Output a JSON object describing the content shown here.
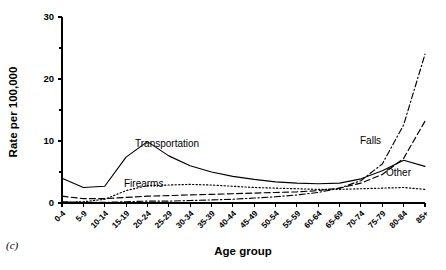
{
  "panel": {
    "letter": "(c)"
  },
  "chart_data": {
    "type": "line",
    "title": "",
    "xlabel": "Age group",
    "ylabel": "Rate per 100,000",
    "ylim": [
      0,
      30
    ],
    "yticks": [
      0,
      10,
      20,
      30
    ],
    "yticks_minor": [
      5,
      15,
      25
    ],
    "grid": false,
    "legend_position": "inline-annotations",
    "categories": [
      "0-4",
      "5-9",
      "10-14",
      "15-19",
      "20-24",
      "25-29",
      "30-34",
      "35-39",
      "40-44",
      "45-49",
      "50-54",
      "55-59",
      "60-64",
      "65-69",
      "70-74",
      "75-79",
      "80-84",
      "85+"
    ],
    "series": [
      {
        "name": "Transportation",
        "style": "solid",
        "label_x_category": "25-29",
        "values": [
          4.0,
          2.5,
          2.7,
          7.4,
          9.9,
          7.6,
          6.0,
          5.0,
          4.3,
          3.8,
          3.4,
          3.2,
          3.1,
          3.2,
          3.9,
          5.2,
          6.9,
          5.9
        ]
      },
      {
        "name": "Firearms",
        "style": "dotted",
        "label_x_category": "25-29",
        "values": [
          0.1,
          0.2,
          0.6,
          2.0,
          2.8,
          2.9,
          3.0,
          2.9,
          2.7,
          2.5,
          2.4,
          2.3,
          2.2,
          2.2,
          2.3,
          2.4,
          2.5,
          2.2
        ]
      },
      {
        "name": "Other",
        "style": "dashed",
        "label_x_category": "80-84",
        "values": [
          1.1,
          0.7,
          0.7,
          0.9,
          1.1,
          1.2,
          1.3,
          1.4,
          1.5,
          1.6,
          1.7,
          1.8,
          2.0,
          2.4,
          3.2,
          4.6,
          7.2,
          13.2
        ]
      },
      {
        "name": "Falls",
        "style": "dashdot",
        "label_x_category": "70-74",
        "values": [
          0.2,
          0.1,
          0.1,
          0.2,
          0.3,
          0.3,
          0.4,
          0.5,
          0.6,
          0.8,
          1.0,
          1.3,
          1.7,
          2.4,
          3.6,
          6.3,
          12.6,
          24.0
        ]
      }
    ]
  }
}
